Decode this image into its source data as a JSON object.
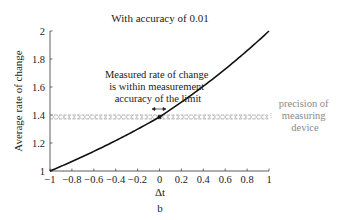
{
  "chart_data": {
    "type": "line",
    "title": "With accuracy of 0.01",
    "xlabel": "Δt",
    "ylabel": "Average rate of change",
    "subfigure_label": "b",
    "xlim": [
      -1,
      1
    ],
    "ylim": [
      1,
      2
    ],
    "x_ticks": [
      "−1",
      "−0.8",
      "−0.6",
      "−0.4",
      "−0.2",
      "0",
      "0.2",
      "0.4",
      "0.6",
      "0.8",
      "1"
    ],
    "y_ticks": [
      "1",
      "1.2",
      "1.4",
      "1.6",
      "1.8",
      "2"
    ],
    "grid": false,
    "series": [
      {
        "name": "average rate of change",
        "x": [
          -1,
          -0.8,
          -0.6,
          -0.4,
          -0.2,
          0,
          0.2,
          0.4,
          0.6,
          0.8,
          1
        ],
        "values": [
          1.0,
          1.07,
          1.14,
          1.22,
          1.3,
          1.386,
          1.48,
          1.58,
          1.7,
          1.84,
          2.0
        ]
      }
    ],
    "highlighted_point": {
      "x": 0,
      "y": 1.386
    },
    "band": {
      "center": 1.386,
      "half_width": 0.01,
      "style": "dashed grey"
    },
    "annotations": [
      {
        "text_lines": [
          "Measured rate of change",
          "is within measurement",
          "accuracy of the limit"
        ],
        "anchor": "point at Δt = 0"
      },
      {
        "text_lines": [
          "precision of",
          "measuring",
          "device"
        ],
        "anchor": "right of dashed band",
        "color": "#8a8a8a"
      }
    ]
  },
  "colors": {
    "curve": "#111111",
    "band": "#999999",
    "annotation_grey": "#8a8a8a"
  }
}
